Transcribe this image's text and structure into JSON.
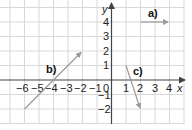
{
  "diagram": {
    "type": "coordinate-grid-vectors",
    "axes": {
      "x_label": "x",
      "y_label": "y",
      "x_ticks": [
        "−6",
        "−5",
        "−4",
        "−3",
        "−2",
        "−1",
        "0",
        "1",
        "2",
        "3",
        "4"
      ],
      "y_ticks": [
        "4",
        "3",
        "2",
        "1",
        "−1",
        "−2"
      ],
      "x_range": [
        -6.5,
        5.3
      ],
      "y_range": [
        -2.9,
        5.1
      ]
    },
    "vectors": [
      {
        "label": "a)",
        "from": [
          2,
          4
        ],
        "to": [
          4,
          4
        ]
      },
      {
        "label": "b)",
        "from": [
          -6,
          -2
        ],
        "to": [
          -2,
          2
        ]
      },
      {
        "label": "c)",
        "from": [
          1,
          1
        ],
        "to": [
          2,
          -2
        ]
      }
    ],
    "colors": {
      "grid": "#d6d6d6",
      "axis": "#444444",
      "vector": "#9a9a9a",
      "text": "#222222"
    }
  }
}
